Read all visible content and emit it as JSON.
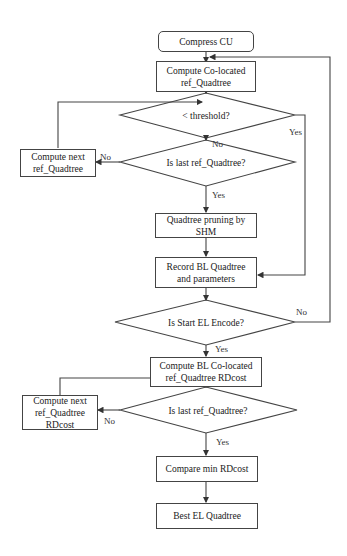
{
  "diagram": {
    "nodes": {
      "start": "Compress CU",
      "compute_colocated": "Compute Co-located ref_Quadtree",
      "threshold_decision": "< threshold?",
      "last_ref_decision_1": "Is last ref_Quadtree?",
      "compute_next_1": "Compute next ref_Quadtree",
      "pruning": "Quadtree pruning by SHM",
      "record": "Record BL Quadtree and parameters",
      "start_el_decision": "Is Start EL Encode?",
      "compute_rdcost": "Compute BL Co-located ref_Quadtree RDcost",
      "last_ref_decision_2": "Is last ref_Quadtree?",
      "compute_next_2": "Compute next ref_Quadtree RDcost",
      "compare": "Compare min RDcost",
      "best": "Best EL Quadtree"
    },
    "edge_labels": {
      "threshold_yes": "Yes",
      "threshold_no": "No",
      "last1_no": "No",
      "last1_yes": "Yes",
      "start_el_no": "No",
      "start_el_yes": "Yes",
      "last2_no": "No",
      "last2_yes": "Yes"
    }
  }
}
